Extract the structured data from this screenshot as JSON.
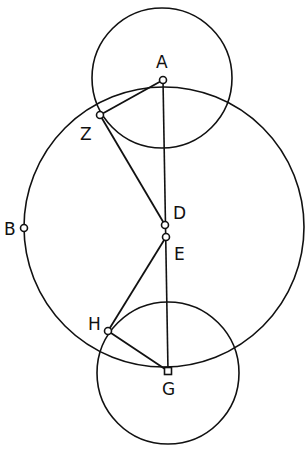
{
  "diagram": {
    "type": "geometry-construction",
    "stroke_color": "#111111",
    "background": "#ffffff",
    "points": {
      "A": {
        "label": "A",
        "x": 163,
        "y": 80
      },
      "Z": {
        "label": "Z",
        "x": 100,
        "y": 115
      },
      "B": {
        "label": "B",
        "x": 24,
        "y": 228
      },
      "D": {
        "label": "D",
        "x": 165,
        "y": 225
      },
      "E": {
        "label": "E",
        "x": 166,
        "y": 237
      },
      "H": {
        "label": "H",
        "x": 108,
        "y": 331
      },
      "G": {
        "label": "G",
        "x": 168,
        "y": 371
      }
    },
    "circles": [
      {
        "name": "circle-centered-A",
        "cx": 162,
        "cy": 78,
        "r": 70
      },
      {
        "name": "circle-large-centered-D",
        "cx": 164,
        "cy": 227,
        "r": 140
      },
      {
        "name": "circle-centered-G",
        "cx": 168,
        "cy": 373,
        "r": 71
      }
    ],
    "segments": [
      "A-Z",
      "Z-D",
      "A-G",
      "E-H",
      "H-G"
    ]
  }
}
